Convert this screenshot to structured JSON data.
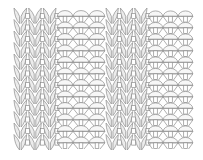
{
  "diagram": {
    "type": "knit-purl rib swatch",
    "colors": {
      "background": "#ffffff",
      "stroke": "#8c8c8c",
      "knit_fill": "#ececec",
      "purl_fill": "#f7f7f7"
    },
    "area": {
      "x": 13,
      "y": 10,
      "width": 180,
      "height": 138
    },
    "rows": 12,
    "bands": [
      {
        "kind": "knit",
        "x": 13,
        "width": 44,
        "stitches": 3
      },
      {
        "kind": "purl",
        "x": 57,
        "width": 48,
        "stitches": 3
      },
      {
        "kind": "knit",
        "x": 105,
        "width": 43,
        "stitches": 3
      },
      {
        "kind": "purl",
        "x": 148,
        "width": 45,
        "stitches": 3
      }
    ]
  }
}
